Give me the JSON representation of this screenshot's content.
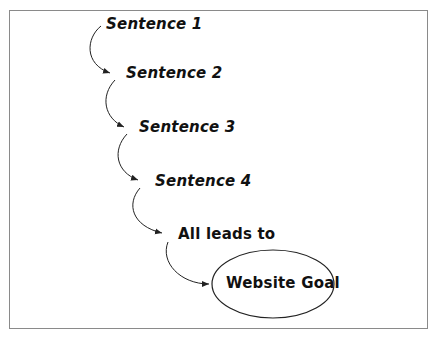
{
  "diagram": {
    "steps": [
      {
        "label": "Sentence 1"
      },
      {
        "label": "Sentence 2"
      },
      {
        "label": "Sentence 3"
      },
      {
        "label": "Sentence 4"
      },
      {
        "label": "All leads to"
      }
    ],
    "goal": {
      "label": "Website Goal"
    },
    "colors": {
      "stroke": "#222222",
      "frame": "#8a8a8a",
      "text": "#111111"
    }
  }
}
